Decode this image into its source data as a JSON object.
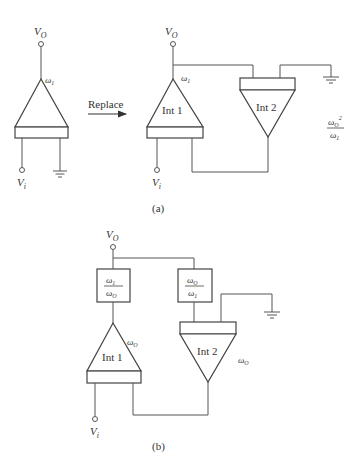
{
  "figure": {
    "part_a": {
      "caption": "(a)",
      "left_amp": {
        "output_label": "V",
        "output_sub": "O",
        "input_label": "V",
        "input_sub": "i",
        "gain_label": "ω",
        "gain_sub": "1"
      },
      "arrow_label": "Replace",
      "int1": {
        "label": "Int 1",
        "output_label": "V",
        "output_sub": "O",
        "input_label": "V",
        "input_sub": "i",
        "gain_label": "ω",
        "gain_sub": "1"
      },
      "int2": {
        "label": "Int 2"
      },
      "int2_gain": {
        "num": "ω",
        "num_sub": "O",
        "num_sup": "2",
        "den": "ω",
        "den_sub": "1"
      }
    },
    "part_b": {
      "caption": "(b)",
      "output_label": "V",
      "output_sub": "O",
      "input_label": "V",
      "input_sub": "i",
      "box1": {
        "num": "ω",
        "num_sub": "1",
        "den": "ω",
        "den_sub": "O"
      },
      "box2": {
        "num": "ω",
        "num_sub": "O",
        "den": "ω",
        "den_sub": "1"
      },
      "int1": {
        "label": "Int 1",
        "gain": "ω",
        "gain_sub": "O"
      },
      "int2": {
        "label": "Int 2",
        "gain": "ω",
        "gain_sub": "O"
      }
    }
  }
}
